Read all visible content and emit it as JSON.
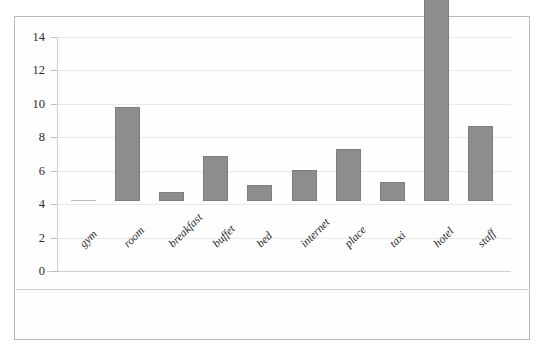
{
  "scan_artifact": {
    "visible": true,
    "fragments": [
      "",
      "",
      "",
      ""
    ]
  },
  "chart_data": {
    "type": "bar",
    "title": "",
    "subtitle": "",
    "xlabel": "",
    "ylabel": "",
    "categories": [
      "gym",
      "room",
      "breakfast",
      "buffet",
      "bed",
      "internet",
      "place",
      "taxi",
      "hotel",
      "staff"
    ],
    "values": [
      0.05,
      5.6,
      0.55,
      2.7,
      0.95,
      1.85,
      3.1,
      1.15,
      12.2,
      4.5
    ],
    "series": [
      {
        "name": "frequency",
        "values": [
          0.05,
          5.6,
          0.55,
          2.7,
          0.95,
          1.85,
          3.1,
          1.15,
          12.2,
          4.5
        ]
      }
    ],
    "ylim": [
      0,
      14
    ],
    "ytick_labels": [
      "0",
      "2",
      "4",
      "6",
      "8",
      "10",
      "12",
      "14"
    ],
    "ytick_values": [
      0,
      2,
      4,
      6,
      8,
      10,
      12,
      14
    ],
    "grid": true,
    "legend": false,
    "legend_position": "none",
    "annotations": [],
    "xlabel_rotation": -45,
    "colors": {
      "bar_fill": "#8d8d8d",
      "bar_edge": "#7d7d7d",
      "gridline": "#e9e9e9",
      "axis": "#cfcfcf",
      "frame": "#b9b9b9",
      "text": "#2b2b2b",
      "background": "#fefefe"
    }
  }
}
